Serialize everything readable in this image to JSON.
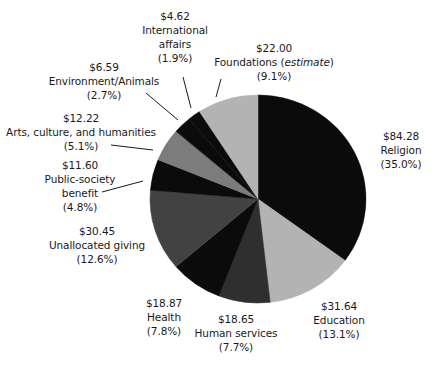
{
  "chart_data": {
    "type": "pie",
    "title": "",
    "units": "billions of dollars",
    "start_angle_deg": 0,
    "direction": "clockwise",
    "slices": [
      {
        "key": "religion",
        "label": "Religion",
        "value": 84.28,
        "value_label": "$84.28",
        "percent": 35.0,
        "percent_label": "(35.0%)",
        "color": "#0b0b0b"
      },
      {
        "key": "education",
        "label": "Education",
        "value": 31.64,
        "value_label": "$31.64",
        "percent": 13.1,
        "percent_label": "(13.1%)",
        "color": "#b3b3b3"
      },
      {
        "key": "human",
        "label": "Human services",
        "value": 18.65,
        "value_label": "$18.65",
        "percent": 7.7,
        "percent_label": "(7.7%)",
        "color": "#2f2f2f"
      },
      {
        "key": "health",
        "label": "Health",
        "value": 18.87,
        "value_label": "$18.87",
        "percent": 7.8,
        "percent_label": "(7.8%)",
        "color": "#0b0b0b"
      },
      {
        "key": "unallocated",
        "label": "Unallocated giving",
        "value": 30.45,
        "value_label": "$30.45",
        "percent": 12.6,
        "percent_label": "(12.6%)",
        "color": "#424242"
      },
      {
        "key": "public",
        "label": "Public-society benefit",
        "value": 11.6,
        "value_label": "$11.60",
        "percent": 4.8,
        "percent_label": "(4.8%)",
        "color": "#0b0b0b"
      },
      {
        "key": "arts",
        "label": "Arts, culture, and humanities",
        "value": 12.22,
        "value_label": "$12.22",
        "percent": 5.1,
        "percent_label": "(5.1%)",
        "color": "#7c7c7c"
      },
      {
        "key": "environment",
        "label": "Environment/Animals",
        "value": 6.59,
        "value_label": "$6.59",
        "percent": 2.7,
        "percent_label": "(2.7%)",
        "color": "#0b0b0b"
      },
      {
        "key": "international",
        "label": "International affairs",
        "value": 4.62,
        "value_label": "$4.62",
        "percent": 1.9,
        "percent_label": "(1.9%)",
        "color": "#0b0b0b"
      },
      {
        "key": "foundations",
        "label": "Foundations (estimate)",
        "value": 22.0,
        "value_label": "$22.00",
        "percent": 9.1,
        "percent_label": "(9.1%)",
        "color": "#b3b3b3"
      }
    ],
    "legend": "none (direct labels with leader lines)"
  },
  "labels": {
    "religion": {
      "value": "$84.28",
      "line1": "Religion",
      "pct": "(35.0%)"
    },
    "education": {
      "value": "$31.64",
      "line1": "Education",
      "pct": "(13.1%)"
    },
    "human": {
      "value": "$18.65",
      "line1": "Human services",
      "pct": "(7.7%)"
    },
    "health": {
      "value": "$18.87",
      "line1": "Health",
      "pct": "(7.8%)"
    },
    "unallocated": {
      "value": "$30.45",
      "line1": "Unallocated giving",
      "pct": "(12.6%)"
    },
    "public": {
      "value": "$11.60",
      "line1": "Public-society",
      "line2": "benefit",
      "pct": "(4.8%)"
    },
    "arts": {
      "value": "$12.22",
      "line1": "Arts, culture, and humanities",
      "pct": "(5.1%)"
    },
    "environment": {
      "value": "$6.59",
      "line1": "Environment/Animals",
      "pct": "(2.7%)"
    },
    "international": {
      "value": "$4.62",
      "line1": "International",
      "line2": "affairs",
      "pct": "(1.9%)"
    },
    "foundations": {
      "value": "$22.00",
      "line1": "Foundations (",
      "line1_em": "estimate",
      "line1_end": ")",
      "pct": "(9.1%)"
    }
  }
}
